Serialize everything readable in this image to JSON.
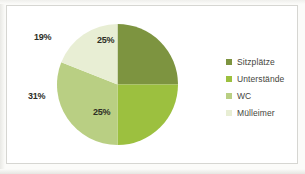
{
  "chart_data": {
    "type": "pie",
    "title": "",
    "categories": [
      "Sitzplätze",
      "Unterständе",
      "WC",
      "Mülleimer"
    ],
    "labels": [
      "Sitzplätze",
      "Unterstände",
      "WC",
      "Mülleimer"
    ],
    "values": [
      25,
      25,
      31,
      19
    ],
    "value_labels": [
      "25%",
      "25%",
      "31%",
      "19%"
    ],
    "unit": "%",
    "colors": [
      "#7d9440",
      "#9cc03f",
      "#b9cf83",
      "#e8eed4"
    ],
    "legend_position": "right",
    "grid": false,
    "start_angle": 0,
    "direction": "clockwise"
  },
  "legend": {
    "items": [
      {
        "label": "Sitzplätze",
        "color": "#7d9440",
        "swatch_name": "legend-swatch-sitzplaetze"
      },
      {
        "label": "Unterstände",
        "color": "#9cc03f",
        "swatch_name": "legend-swatch-unterstaende"
      },
      {
        "label": "WC",
        "color": "#b9cf83",
        "swatch_name": "legend-swatch-wc"
      },
      {
        "label": "Mülleimer",
        "color": "#e8eed4",
        "swatch_name": "legend-swatch-muelleimer"
      }
    ]
  },
  "slice_labels": {
    "sitzplaetze": "25%",
    "unterstaende": "25%",
    "wc": "31%",
    "muelleimer": "19%"
  },
  "style": {
    "card_background": "#ffffff",
    "card_border": "#d6d6d2",
    "page_background": "#fbfbf9",
    "label_color": "#2e2e26",
    "legend_text_color": "#45453c"
  }
}
